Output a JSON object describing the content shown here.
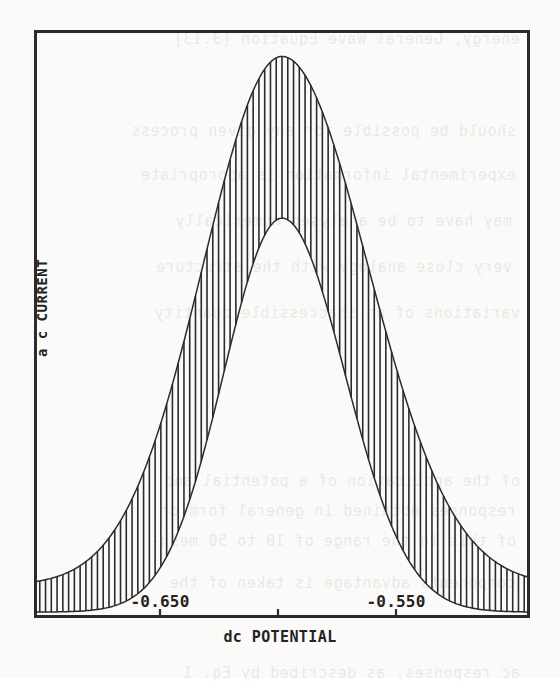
{
  "figure": {
    "kind": "ac-voltammogram",
    "background_color": "#fbfaf8",
    "ink_color": "#2b2b2b",
    "frame": {
      "x": 34,
      "y": 30,
      "width": 496,
      "height": 588,
      "border_px": 3
    }
  },
  "axes": {
    "y": {
      "label": "a c CURRENT",
      "ticks": [],
      "tick_labels": []
    },
    "x": {
      "label": "dc POTENTIAL",
      "tick_labels": [
        "-0.650",
        "",
        "-0.550"
      ],
      "tick_positions_px": [
        160,
        278,
        396
      ],
      "tick_values": [
        -0.65,
        -0.6,
        -0.55
      ],
      "labelled_ticks": [
        {
          "text": "-0.650",
          "x_px": 160
        },
        {
          "text": "-0.550",
          "x_px": 396
        }
      ]
    }
  },
  "chart_data": {
    "type": "line",
    "title": "",
    "subtitle": "",
    "xlabel": "dc POTENTIAL",
    "ylabel": "a c CURRENT",
    "xlim": [
      -0.7085,
      -0.4915
    ],
    "ylim": [
      0,
      1
    ],
    "grid": false,
    "legend": "none",
    "annotations": [],
    "modulation": {
      "spike_count": 86,
      "spike_spacing_px": 5.7,
      "spike_line_width_px": 1.6
    },
    "series": [
      {
        "name": "outer envelope (ac peak maxima)",
        "kind": "envelope-upper",
        "peak_x": -0.6,
        "peak_y": 0.955,
        "baseline_y": 0.055,
        "sigma_left": 0.0345,
        "sigma_right": 0.0375,
        "x": [
          -0.7085,
          -0.695,
          -0.68,
          -0.665,
          -0.65,
          -0.635,
          -0.62,
          -0.61,
          -0.6,
          -0.59,
          -0.58,
          -0.565,
          -0.55,
          -0.535,
          -0.52,
          -0.505,
          -0.4915
        ],
        "y": [
          0.055,
          0.06,
          0.075,
          0.11,
          0.19,
          0.33,
          0.56,
          0.76,
          0.955,
          0.88,
          0.72,
          0.47,
          0.265,
          0.145,
          0.09,
          0.065,
          0.055
        ]
      },
      {
        "name": "inner envelope (ac peak minima)",
        "kind": "envelope-lower",
        "peak_x": -0.6,
        "peak_y": 0.68,
        "baseline_y": 0.01,
        "sigma_left": 0.0255,
        "sigma_right": 0.0275,
        "x": [
          -0.7085,
          -0.695,
          -0.68,
          -0.665,
          -0.65,
          -0.635,
          -0.62,
          -0.61,
          -0.6,
          -0.59,
          -0.58,
          -0.565,
          -0.55,
          -0.535,
          -0.52,
          -0.505,
          -0.4915
        ],
        "y": [
          0.01,
          0.012,
          0.018,
          0.03,
          0.06,
          0.14,
          0.33,
          0.51,
          0.68,
          0.6,
          0.43,
          0.195,
          0.08,
          0.035,
          0.018,
          0.012,
          0.01
        ]
      }
    ]
  },
  "showthrough": {
    "note": "faint mirrored text bleeding through from the reverse side of the scanned page",
    "lines": [
      {
        "text": "energy, General Wave Equation [3.13]",
        "x": 40,
        "y": 16
      },
      {
        "text": "should be possible for any given process",
        "x": 44,
        "y": 108
      },
      {
        "text": "experimental information is appropriate",
        "x": 44,
        "y": 152
      },
      {
        "text": "may have to be analysed numerically",
        "x": 48,
        "y": 198
      },
      {
        "text": "very close analogy with the structure",
        "x": 48,
        "y": 244
      },
      {
        "text": "variations of an inaccessible quantity",
        "x": 40,
        "y": 290
      },
      {
        "text": "of the application of a potential and",
        "x": 40,
        "y": 458
      },
      {
        "text": "responses obtained in general form or",
        "x": 44,
        "y": 488
      },
      {
        "text": "of this in the range of 10 to 50 mesh-",
        "x": 44,
        "y": 518
      },
      {
        "text": "components advantage is taken of the",
        "x": 44,
        "y": 560
      },
      {
        "text": "ac responses, as described by Eq. 1",
        "x": 40,
        "y": 650
      }
    ]
  }
}
